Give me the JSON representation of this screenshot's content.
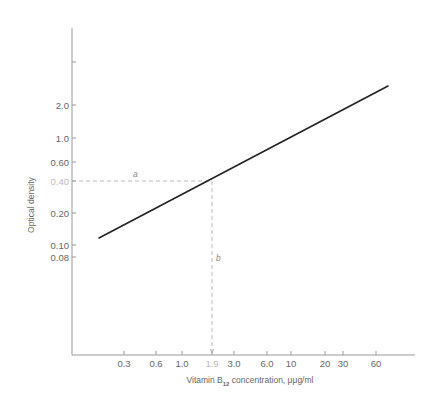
{
  "chart_data": {
    "type": "line",
    "title": "",
    "xlabel": "Vitamin B12 concentration, μμg/ml",
    "xlabel_parts": {
      "prefix": "Vitamin B",
      "subscript": "12",
      "suffix": " concentration, μμg/ml"
    },
    "ylabel": "Optical density",
    "x_scale": "log",
    "y_scale": "log",
    "x_ticks": [
      {
        "value": 0.3,
        "label": "0.3",
        "px": 124
      },
      {
        "value": 0.6,
        "label": "0.6",
        "px": 156
      },
      {
        "value": 1.0,
        "label": "1.0",
        "px": 182
      },
      {
        "value": 1.9,
        "label": "1.9",
        "px": 212,
        "faded": true
      },
      {
        "value": 3.0,
        "label": "3.0",
        "px": 234
      },
      {
        "value": 6.0,
        "label": "6.0",
        "px": 267
      },
      {
        "value": 10,
        "label": "10",
        "px": 291
      },
      {
        "value": 20,
        "label": "20",
        "px": 325
      },
      {
        "value": 30,
        "label": "30",
        "px": 343
      },
      {
        "value": 60,
        "label": "60",
        "px": 376
      }
    ],
    "y_ticks": [
      {
        "value": 5.0,
        "label": "",
        "px": 62
      },
      {
        "value": 2.0,
        "label": "2.0",
        "px": 105
      },
      {
        "value": 1.0,
        "label": "1.0",
        "px": 138
      },
      {
        "value": 0.6,
        "label": "0.60",
        "px": 162
      },
      {
        "value": 0.4,
        "label": "0.40",
        "px": 181,
        "faded": true
      },
      {
        "value": 0.2,
        "label": "0.20",
        "px": 213
      },
      {
        "value": 0.1,
        "label": "0.10",
        "px": 245
      },
      {
        "value": 0.08,
        "label": "0.08",
        "px": 257
      }
    ],
    "series": [
      {
        "name": "standard curve",
        "color": "#222222",
        "points": [
          {
            "x": 0.15,
            "y": 0.12
          },
          {
            "x": 1.9,
            "y": 0.4
          },
          {
            "x": 85,
            "y": 2.6
          }
        ],
        "px_points": [
          [
            99,
            238
          ],
          [
            388,
            86
          ]
        ]
      }
    ],
    "annotations": [
      {
        "label": "a",
        "type": "horizontal-dashed",
        "y_value": 0.4,
        "from_x_px": 72,
        "to_x_px": 212,
        "y_px": 181,
        "text_px": [
          133,
          177
        ]
      },
      {
        "label": "b",
        "type": "vertical-dashed",
        "x_value": 1.9,
        "from_y_px": 181,
        "to_y_px": 353,
        "x_px": 212,
        "text_px": [
          216,
          261
        ]
      }
    ],
    "axes_px": {
      "origin": [
        72,
        355
      ],
      "y_top": 28,
      "x_right": 415
    },
    "grid": false,
    "legend": "none"
  }
}
